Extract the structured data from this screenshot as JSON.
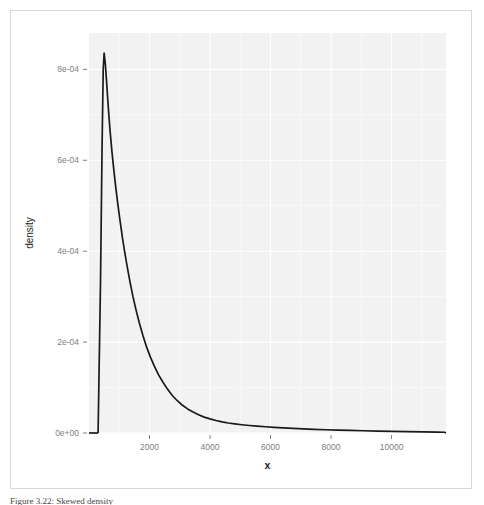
{
  "figure": {
    "caption": "Figure 3.22: Skewed density"
  },
  "chart_data": {
    "type": "line",
    "title": "",
    "xlabel": "x",
    "ylabel": "density",
    "xlim": [
      0,
      11800
    ],
    "ylim": [
      0,
      0.00088
    ],
    "xticks": [
      2000,
      4000,
      6000,
      8000,
      10000
    ],
    "xticklabels": [
      "2000",
      "4000",
      "6000",
      "8000",
      "10000"
    ],
    "yticks": [
      0,
      0.0002,
      0.0004,
      0.0006,
      0.0008
    ],
    "yticklabels": [
      "0e+00",
      "2e-04",
      "4e-04",
      "6e-04",
      "8e-04"
    ],
    "grid": true,
    "legend": "none",
    "panel_background": "#f2f2f2",
    "grid_color": "#ffffff",
    "line_color": "#1a1a1a",
    "line_width": 1.7,
    "series": [
      {
        "name": "density",
        "x": [
          300,
          380,
          430,
          470,
          500,
          540,
          580,
          620,
          660,
          700,
          760,
          820,
          880,
          950,
          1020,
          1100,
          1180,
          1260,
          1350,
          1450,
          1550,
          1660,
          1780,
          1900,
          2030,
          2160,
          2300,
          2450,
          2600,
          2760,
          2920,
          3090,
          3260,
          3440,
          3620,
          3810,
          4000,
          4200,
          4400,
          4600,
          4820,
          5050,
          5300,
          5560,
          5830,
          6120,
          6420,
          6740,
          7080,
          7440,
          7820,
          8220,
          8640,
          9080,
          9540,
          10020,
          10520,
          11040,
          11500,
          11750
        ],
        "y": [
          0.0,
          0.00033,
          0.00062,
          0.0008,
          0.000836,
          0.000812,
          0.000774,
          0.000734,
          0.000696,
          0.000662,
          0.000618,
          0.000579,
          0.000543,
          0.000505,
          0.00047,
          0.000432,
          0.000398,
          0.000367,
          0.000334,
          0.000301,
          0.000272,
          0.000243,
          0.000215,
          0.00019,
          0.000167,
          0.000147,
          0.000128,
          0.000111,
          9.6e-05,
          8.2e-05,
          7.1e-05,
          6.1e-05,
          5.3e-05,
          4.6e-05,
          4e-05,
          3.5e-05,
          3.1e-05,
          2.75e-05,
          2.45e-05,
          2.2e-05,
          2e-05,
          1.82e-05,
          1.65e-05,
          1.5e-05,
          1.37e-05,
          1.24e-05,
          1.12e-05,
          1.01e-05,
          9.1e-06,
          8.1e-06,
          7.2e-06,
          6.4e-06,
          5.6e-06,
          4.9e-06,
          4.2e-06,
          3.6e-06,
          3e-06,
          2.4e-06,
          1.9e-06,
          1.6e-06
        ]
      }
    ]
  }
}
